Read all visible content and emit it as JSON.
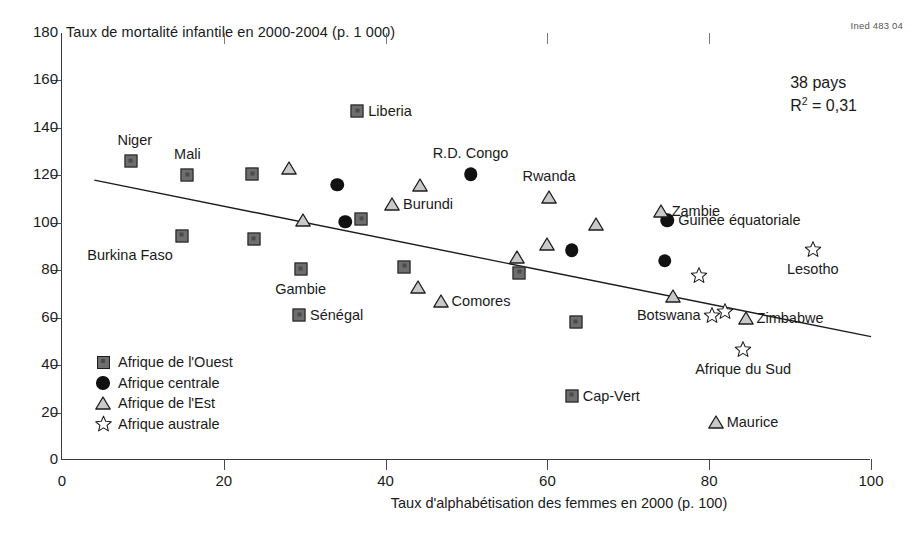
{
  "figure": {
    "credit": "Ined 483 04",
    "y_axis_title": "Taux de mortalité infantile en 2000-2004 (p. 1 000)",
    "x_axis_title": "Taux d'alphabétisation des femmes en 2000 (p. 100)",
    "annotation_countries": "38 pays",
    "annotation_r2_prefix": "R",
    "annotation_r2_exp": "2",
    "annotation_r2_value": " = 0,31"
  },
  "legend": {
    "items": [
      {
        "label": "Afrique de l'Ouest",
        "glyph": "square-marker",
        "color": "#6e6e6e"
      },
      {
        "label": "Afrique centrale",
        "glyph": "circle-marker",
        "color": "#111111"
      },
      {
        "label": "Afrique de l'Est",
        "glyph": "triangle-marker",
        "color": "#c9c9c9"
      },
      {
        "label": "Afrique australe",
        "glyph": "star-marker",
        "color": "#ffffff"
      }
    ]
  },
  "chart_data": {
    "type": "scatter",
    "title": "",
    "xlabel": "Taux d'alphabétisation des femmes en 2000 (p. 100)",
    "ylabel": "Taux de mortalité infantile en 2000-2004 (p. 1 000)",
    "xlim": [
      0,
      100
    ],
    "ylim": [
      0,
      180
    ],
    "xticks": [
      0,
      20,
      40,
      60,
      80,
      100
    ],
    "yticks": [
      0,
      20,
      40,
      60,
      80,
      100,
      120,
      140,
      160,
      180
    ],
    "grid": false,
    "legend_position": "lower-left-inside",
    "n_countries": 38,
    "r_squared": 0.31,
    "trendline": {
      "x": [
        4,
        100
      ],
      "y": [
        118,
        52
      ]
    },
    "series": [
      {
        "name": "Afrique de l'Ouest",
        "marker": "square",
        "color": "#6e6e6e",
        "points": [
          {
            "label": "Niger",
            "x": 8.5,
            "y": 126,
            "label_pos": "above-left"
          },
          {
            "label": "Mali",
            "x": 15.5,
            "y": 120,
            "label_pos": "above"
          },
          {
            "label": "Burkina Faso",
            "x": 14.8,
            "y": 94.5,
            "label_pos": "below-left"
          },
          {
            "label": "",
            "x": 23.5,
            "y": 120.5,
            "label_pos": "none"
          },
          {
            "label": "",
            "x": 23.7,
            "y": 93,
            "label_pos": "none"
          },
          {
            "label": "Gambie",
            "x": 29.5,
            "y": 80.5,
            "label_pos": "below"
          },
          {
            "label": "Sénégal",
            "x": 29.3,
            "y": 61,
            "label_pos": "right"
          },
          {
            "label": "",
            "x": 37.0,
            "y": 101.5,
            "label_pos": "none"
          },
          {
            "label": "",
            "x": 42.3,
            "y": 81.5,
            "label_pos": "none"
          },
          {
            "label": "Liberia",
            "x": 36.5,
            "y": 147,
            "label_pos": "right"
          },
          {
            "label": "",
            "x": 56.5,
            "y": 79,
            "label_pos": "none"
          },
          {
            "label": "",
            "x": 63.5,
            "y": 58,
            "label_pos": "none"
          },
          {
            "label": "Cap-Vert",
            "x": 63.0,
            "y": 27,
            "label_pos": "right"
          }
        ]
      },
      {
        "name": "Afrique centrale",
        "marker": "circle",
        "color": "#111111",
        "points": [
          {
            "label": "",
            "x": 34.0,
            "y": 116,
            "label_pos": "none"
          },
          {
            "label": "",
            "x": 35.0,
            "y": 100.5,
            "label_pos": "none"
          },
          {
            "label": "R.D. Congo",
            "x": 50.5,
            "y": 120.5,
            "label_pos": "above"
          },
          {
            "label": "",
            "x": 63.0,
            "y": 88.5,
            "label_pos": "none"
          },
          {
            "label": "Guinée équatoriale",
            "x": 74.8,
            "y": 101,
            "label_pos": "right"
          },
          {
            "label": "",
            "x": 74.5,
            "y": 84,
            "label_pos": "none"
          }
        ]
      },
      {
        "name": "Afrique de l'Est",
        "marker": "triangle",
        "color": "#c9c9c9",
        "points": [
          {
            "label": "",
            "x": 28.0,
            "y": 123,
            "label_pos": "none"
          },
          {
            "label": "",
            "x": 29.8,
            "y": 101,
            "label_pos": "none"
          },
          {
            "label": "Burundi",
            "x": 40.8,
            "y": 108,
            "label_pos": "right"
          },
          {
            "label": "",
            "x": 44.2,
            "y": 116,
            "label_pos": "none"
          },
          {
            "label": "",
            "x": 44.0,
            "y": 73,
            "label_pos": "none"
          },
          {
            "label": "Comores",
            "x": 46.8,
            "y": 67,
            "label_pos": "right"
          },
          {
            "label": "",
            "x": 56.2,
            "y": 85.5,
            "label_pos": "none"
          },
          {
            "label": "Rwanda",
            "x": 60.2,
            "y": 111,
            "label_pos": "above"
          },
          {
            "label": "",
            "x": 60.0,
            "y": 91,
            "label_pos": "none"
          },
          {
            "label": "",
            "x": 66.0,
            "y": 99.5,
            "label_pos": "none"
          },
          {
            "label": "Zambie",
            "x": 74.0,
            "y": 105,
            "label_pos": "right"
          },
          {
            "label": "",
            "x": 75.5,
            "y": 69,
            "label_pos": "none"
          },
          {
            "label": "Zimbabwe",
            "x": 84.5,
            "y": 60,
            "label_pos": "right"
          },
          {
            "label": "Maurice",
            "x": 80.8,
            "y": 16,
            "label_pos": "right"
          }
        ]
      },
      {
        "name": "Afrique australe",
        "marker": "star",
        "color": "#ffffff",
        "points": [
          {
            "label": "",
            "x": 78.8,
            "y": 78,
            "label_pos": "none"
          },
          {
            "label": "Botswana",
            "x": 80.3,
            "y": 61,
            "label_pos": "left"
          },
          {
            "label": "",
            "x": 81.9,
            "y": 63,
            "label_pos": "none"
          },
          {
            "label": "Afrique du Sud",
            "x": 84.2,
            "y": 47,
            "label_pos": "below"
          },
          {
            "label": "Lesotho",
            "x": 92.8,
            "y": 89,
            "label_pos": "below"
          }
        ]
      }
    ]
  }
}
